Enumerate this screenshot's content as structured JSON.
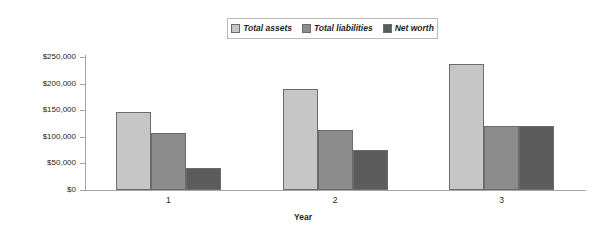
{
  "chart_data": {
    "type": "bar",
    "title": "",
    "subtitle": "",
    "xlabel": "Year",
    "ylabel": "",
    "categories": [
      "1",
      "2",
      "3"
    ],
    "series": [
      {
        "name": "Total assets",
        "color": "#c6c6c6",
        "values": [
          147000,
          190000,
          236000
        ]
      },
      {
        "name": "Total liabilities",
        "color": "#8c8c8c",
        "values": [
          107000,
          113000,
          120000
        ]
      },
      {
        "name": "Net worth",
        "color": "#5c5c5c",
        "values": [
          41000,
          75000,
          120000
        ]
      }
    ],
    "ylim": [
      0,
      250000
    ],
    "ytick_values": [
      0,
      50000,
      100000,
      150000,
      200000,
      250000
    ],
    "ytick_labels": [
      "$0",
      "$50,000",
      "$100,000",
      "$150,000",
      "$200,000",
      "$250,000"
    ],
    "grid": false,
    "legend_position": "top-center"
  },
  "legend": {
    "entries": [
      {
        "label": "Total assets"
      },
      {
        "label": "Total liabilities"
      },
      {
        "label": "Net worth"
      }
    ]
  },
  "axes": {
    "x_title": "Year"
  }
}
